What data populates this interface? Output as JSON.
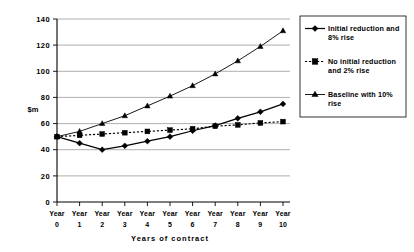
{
  "chart_data": {
    "type": "line",
    "title": "",
    "xlabel": "Years of contract",
    "ylabel": "$m",
    "x": [
      0,
      1,
      2,
      3,
      4,
      5,
      6,
      7,
      8,
      9,
      10
    ],
    "categories": [
      "Year 0",
      "Year 1",
      "Year 2",
      "Year 3",
      "Year 4",
      "Year 5",
      "Year 6",
      "Year 7",
      "Year 8",
      "Year 9",
      "Year 10"
    ],
    "xtick_labels_line1": [
      "Year",
      "Year",
      "Year",
      "Year",
      "Year",
      "Year",
      "Year",
      "Year",
      "Year",
      "Year",
      "Year"
    ],
    "xtick_labels_line2": [
      "0",
      "1",
      "2",
      "3",
      "4",
      "5",
      "6",
      "7",
      "8",
      "9",
      "10"
    ],
    "ylim": [
      0,
      140
    ],
    "ytick_values": [
      0,
      20,
      40,
      60,
      80,
      100,
      120,
      140
    ],
    "ytick_labels": [
      "0",
      "20",
      "40",
      "60",
      "80",
      "100",
      "120",
      "140"
    ],
    "grid": "horizontal",
    "legend_position": "right",
    "series": [
      {
        "name": "Initial reduction and 8% rise",
        "marker": "diamond",
        "linestyle": "solid",
        "color": "#000000",
        "values": [
          50,
          45,
          40,
          43,
          46.5,
          50,
          54.5,
          58.5,
          64,
          69,
          75
        ]
      },
      {
        "name": "No initial reduction and 2% rise",
        "marker": "square",
        "linestyle": "dashed",
        "color": "#000000",
        "values": [
          50,
          51,
          52,
          53,
          54,
          55,
          56,
          58,
          59,
          60.5,
          61.5
        ]
      },
      {
        "name": "Baseline with 10% rise",
        "marker": "triangle",
        "linestyle": "solid",
        "color": "#000000",
        "values": [
          50,
          54,
          60,
          66,
          73.5,
          81,
          89,
          98,
          108,
          119,
          131
        ]
      }
    ]
  },
  "legend": {
    "entries": [
      {
        "label_line1": "Initial reduction and",
        "label_line2": "8% rise"
      },
      {
        "label_line1": "No initial reduction",
        "label_line2": "and 2% rise"
      },
      {
        "label_line1": "Baseline with 10%",
        "label_line2": "rise"
      }
    ]
  }
}
